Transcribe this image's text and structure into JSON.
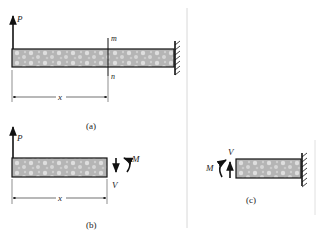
{
  "figure": {
    "panels": [
      {
        "id": "a",
        "caption": "(a)",
        "labels": {
          "load": "P",
          "section_top": "m",
          "section_bottom": "n",
          "distance": "x"
        }
      },
      {
        "id": "b",
        "caption": "(b)",
        "labels": {
          "load": "P",
          "moment": "M",
          "shear": "V",
          "distance": "x"
        }
      },
      {
        "id": "c",
        "caption": "(c)",
        "labels": {
          "moment": "M",
          "shear": "V"
        }
      }
    ],
    "colors": {
      "line": "#111111",
      "beam_fill": "#b8b8b8",
      "beam_speckle": "#e2e2e2",
      "divider": "#d8d8d8"
    }
  }
}
